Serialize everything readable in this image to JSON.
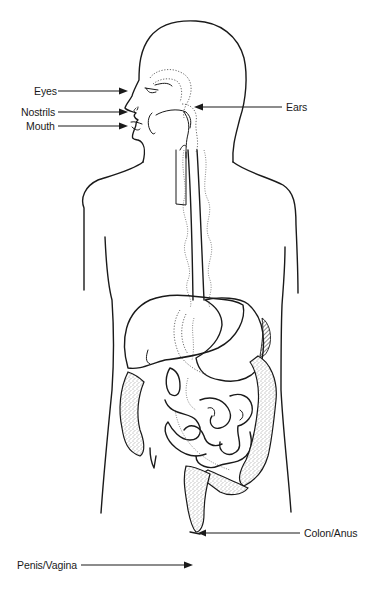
{
  "diagram": {
    "labels": [
      {
        "id": "eyes",
        "text": "Eyes",
        "x": 34,
        "y": 85,
        "arrow_from": [
          58,
          91
        ],
        "arrow_to": [
          127,
          91
        ],
        "side": "left"
      },
      {
        "id": "nostrils",
        "text": "Nostrils",
        "x": 21,
        "y": 106,
        "arrow_from": [
          58,
          112
        ],
        "arrow_to": [
          127,
          112
        ],
        "side": "left"
      },
      {
        "id": "mouth",
        "text": "Mouth",
        "x": 26,
        "y": 120,
        "arrow_from": [
          58,
          126
        ],
        "arrow_to": [
          127,
          126
        ],
        "side": "left"
      },
      {
        "id": "ears",
        "text": "Ears",
        "x": 286,
        "y": 101,
        "arrow_from": [
          282,
          107
        ],
        "arrow_to": [
          195,
          107
        ],
        "side": "right"
      },
      {
        "id": "colon_anus",
        "text": "Colon/Anus",
        "x": 303,
        "y": 527,
        "arrow_from": [
          300,
          533
        ],
        "arrow_to": [
          198,
          533
        ],
        "side": "right"
      },
      {
        "id": "penis_vagina",
        "text": "Penis/Vagina",
        "x": 17,
        "y": 558,
        "arrow_from": [
          80,
          564
        ],
        "arrow_to": [
          192,
          564
        ],
        "side": "left"
      }
    ]
  },
  "colors": {
    "line": "#1a1a1a",
    "background": "#ffffff"
  }
}
